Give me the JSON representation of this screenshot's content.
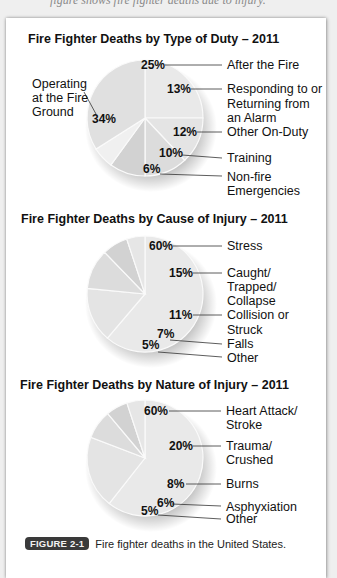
{
  "header": {
    "cut_off_text": "figure shows fire fighter deaths due to injury."
  },
  "figure": {
    "badge": "FIGURE 2-1",
    "caption": "Fire fighter deaths in the United States."
  },
  "chart_data": [
    {
      "type": "pie",
      "title": "Fire Fighter Deaths by Type of Duty – 2011",
      "categories": [
        "After the Fire",
        "Responding to or Returning from an Alarm",
        "Other On-Duty",
        "Training",
        "Non-fire Emergencies",
        "Operating at the Fire Ground"
      ],
      "values": [
        25,
        13,
        12,
        10,
        6,
        34
      ],
      "labels": [
        "25%",
        "13%",
        "12%",
        "10%",
        "6%",
        "34%"
      ]
    },
    {
      "type": "pie",
      "title": "Fire Fighter Deaths by Cause of Injury – 2011",
      "categories": [
        "Stress",
        "Caught/ Trapped/ Collapse",
        "Collision or Struck",
        "Falls",
        "Other"
      ],
      "values": [
        60,
        15,
        11,
        7,
        5
      ],
      "labels": [
        "60%",
        "15%",
        "11%",
        "7%",
        "5%"
      ]
    },
    {
      "type": "pie",
      "title": "Fire Fighter Deaths by Nature of Injury – 2011",
      "categories": [
        "Heart Attack/ Stroke",
        "Trauma/ Crushed",
        "Burns",
        "Asphyxiation",
        "Other"
      ],
      "values": [
        60,
        20,
        8,
        6,
        5
      ],
      "labels": [
        "60%",
        "20%",
        "8%",
        "6%",
        "5%"
      ]
    }
  ],
  "charts": {
    "duty": {
      "title": "Fire Fighter Deaths by Type of Duty – 2011",
      "p_after": "25%",
      "l_after": "After the Fire",
      "p_resp": "13%",
      "l_resp1": "Responding to or",
      "l_resp2": "Returning from",
      "l_resp3": "an Alarm",
      "p_other": "12%",
      "l_other": "Other On-Duty",
      "p_train": "10%",
      "l_train": "Training",
      "p_nonfire": "6%",
      "l_nonfire1": "Non-fire",
      "l_nonfire2": "Emergencies",
      "p_oper": "34%",
      "l_oper1": "Operating",
      "l_oper2": "at the Fire",
      "l_oper3": "Ground"
    },
    "cause": {
      "title": "Fire Fighter Deaths by Cause of Injury – 2011",
      "p_stress": "60%",
      "l_stress": "Stress",
      "p_caught": "15%",
      "l_caught1": "Caught/",
      "l_caught2": "Trapped/",
      "l_caught3": "Collapse",
      "p_coll": "11%",
      "l_coll1": "Collision or",
      "l_coll2": "Struck",
      "p_falls": "7%",
      "l_falls": "Falls",
      "p_other": "5%",
      "l_other": "Other"
    },
    "nature": {
      "title": "Fire Fighter Deaths by Nature of Injury – 2011",
      "p_heart": "60%",
      "l_heart1": "Heart Attack/",
      "l_heart2": "Stroke",
      "p_trauma": "20%",
      "l_trauma1": "Trauma/",
      "l_trauma2": "Crushed",
      "p_burns": "8%",
      "l_burns": "Burns",
      "p_asph": "6%",
      "l_asph": "Asphyxiation",
      "p_other": "5%",
      "l_other": "Other"
    }
  }
}
